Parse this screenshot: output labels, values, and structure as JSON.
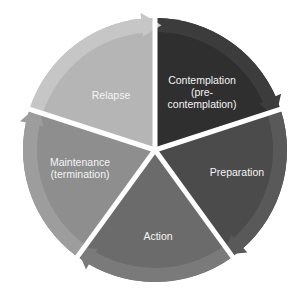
{
  "diagram": {
    "type": "cycle",
    "title": "",
    "center": [
      155,
      150
    ],
    "radius": 132,
    "gap_color": "#ffffff",
    "start_angle_deg": -90,
    "segments": [
      {
        "id": "contemplation",
        "lines": [
          "Contemplation",
          "(pre-",
          "contemplation)"
        ],
        "fill": "#2f2f2f",
        "band": "#3c3c3c",
        "label_pos": [
          202,
          92
        ]
      },
      {
        "id": "preparation",
        "lines": [
          "Preparation"
        ],
        "fill": "#4b4b4b",
        "band": "#595959",
        "label_pos": [
          237,
          172
        ]
      },
      {
        "id": "action",
        "lines": [
          "Action"
        ],
        "fill": "#6b6b6b",
        "band": "#7a7a7a",
        "label_pos": [
          158,
          236
        ]
      },
      {
        "id": "maintenance",
        "lines": [
          "Maintenance",
          "(termination)"
        ],
        "fill": "#8e8e8e",
        "band": "#9d9d9d",
        "label_pos": [
          80,
          168
        ]
      },
      {
        "id": "relapse",
        "lines": [
          "Relapse"
        ],
        "fill": "#b5b5b5",
        "band": "#c6c6c6",
        "label_pos": [
          111,
          95
        ]
      }
    ]
  }
}
